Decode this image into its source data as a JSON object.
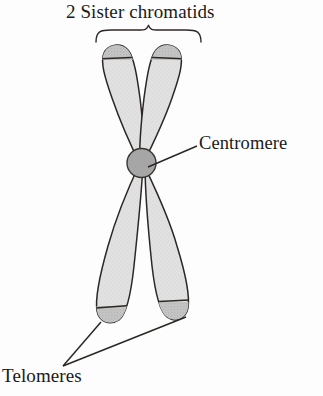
{
  "figure": {
    "kind": "biology-diagram",
    "background_color": "#fdfdfd",
    "ink_color": "#1c1a18"
  },
  "labels": {
    "title": "2 Sister chromatids",
    "centromere": "Centromere",
    "telomeres": "Telomeres"
  },
  "colors": {
    "arm_fill": "#dedede",
    "telomere_cap_fill": "#c2c2c2",
    "centromere_fill": "#a6a6a6",
    "outline": "#2b2724",
    "leader_line": "#2b2724"
  },
  "parts": [
    {
      "name": "upper-left-chromatid-arm",
      "label": "Upper left chromatid arm",
      "fill": "#dedede"
    },
    {
      "name": "upper-right-chromatid-arm",
      "label": "Upper right chromatid arm",
      "fill": "#dedede"
    },
    {
      "name": "lower-left-chromatid-arm",
      "label": "Lower left chromatid arm",
      "fill": "#dedede"
    },
    {
      "name": "lower-right-chromatid-arm",
      "label": "Lower right chromatid arm",
      "fill": "#dedede"
    },
    {
      "name": "centromere",
      "label": "Centromere",
      "fill": "#a6a6a6"
    },
    {
      "name": "telomere-cap",
      "label": "Telomere",
      "count": 4,
      "fill": "#c2c2c2"
    }
  ],
  "annotations": {
    "brace": {
      "name": "sister-chromatids-brace",
      "spans": "2 Sister chromatids",
      "left_x": 96,
      "right_x": 201,
      "y": 30
    },
    "centromere_leader": {
      "from_x": 148,
      "from_y": 167,
      "to_x": 197,
      "to_y": 146
    },
    "telomere_leaders": [
      {
        "from_x": 63,
        "from_y": 366,
        "to_x": 101,
        "to_y": 322
      },
      {
        "from_x": 63,
        "from_y": 366,
        "to_x": 186,
        "to_y": 317
      }
    ]
  }
}
